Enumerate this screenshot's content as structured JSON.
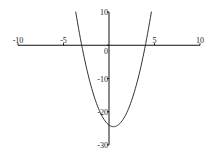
{
  "chart_data": {
    "type": "line",
    "title": "",
    "xlabel": "",
    "ylabel": "",
    "xlim": [
      -10,
      10
    ],
    "ylim": [
      -30,
      10
    ],
    "grid": false,
    "legend": null,
    "x_ticks": [
      -10,
      -5,
      5,
      10
    ],
    "x_tick_labels": [
      "-10",
      "-5",
      "5",
      "10"
    ],
    "y_ticks": [
      10,
      0,
      -10,
      -20,
      -30
    ],
    "y_tick_labels": [
      "10",
      "0",
      "-10",
      "-20",
      "-30"
    ],
    "series": [
      {
        "name": "y = 2x^2 - 2x - 24",
        "function": {
          "a": 2,
          "b": -2,
          "c": -24
        },
        "x_range": [
          -3.66,
          4.66
        ],
        "points": [
          {
            "x": -3.66,
            "y": 10
          },
          {
            "x": -3,
            "y": 0
          },
          {
            "x": -2,
            "y": -12
          },
          {
            "x": -1,
            "y": -20
          },
          {
            "x": 0,
            "y": -24
          },
          {
            "x": 0.5,
            "y": -24.5
          },
          {
            "x": 1,
            "y": -24
          },
          {
            "x": 2,
            "y": -20
          },
          {
            "x": 3,
            "y": -12
          },
          {
            "x": 4,
            "y": 0
          },
          {
            "x": 4.66,
            "y": 10
          }
        ],
        "color": "#333333"
      }
    ]
  }
}
